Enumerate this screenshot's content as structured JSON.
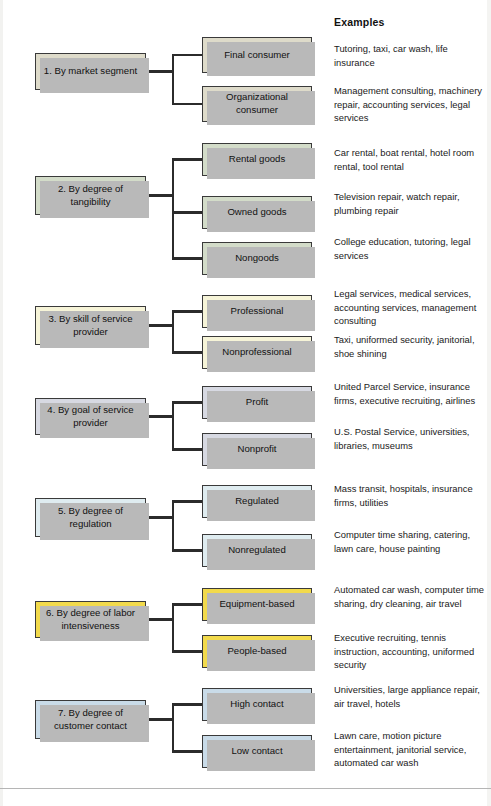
{
  "header": {
    "examples_label": "Examples"
  },
  "colors": {
    "section1": "#dedbca",
    "section2": "#d3dcc9",
    "section3": "#f6f4d8",
    "section4": "#d7d9e2",
    "section5": "#dfecf0",
    "section6": "#f2da4c",
    "section7": "#c9dbe8",
    "box_border": "#3a3a3a",
    "connector": "#2b2b2b",
    "shadow": "#b9b9b9",
    "text": "#111111"
  },
  "sections": [
    {
      "id": "market-segment",
      "category": "1. By market segment",
      "color": "#dedbca",
      "children": [
        {
          "label": "Final consumer",
          "examples": "Tutoring, taxi, car wash, life insurance"
        },
        {
          "label": "Organizational consumer",
          "examples": "Management consulting, machinery repair, accounting services, legal services"
        }
      ]
    },
    {
      "id": "degree-of-tangibility",
      "category": "2. By degree of tangibility",
      "color": "#d3dcc9",
      "children": [
        {
          "label": "Rental goods",
          "examples": "Car rental, boat rental, hotel room rental, tool rental"
        },
        {
          "label": "Owned goods",
          "examples": "Television repair, watch repair, plumbing repair"
        },
        {
          "label": "Nongoods",
          "examples": "College education, tutoring, legal services"
        }
      ]
    },
    {
      "id": "skill-of-service-provider",
      "category": "3. By skill of service provider",
      "color": "#f6f4d8",
      "children": [
        {
          "label": "Professional",
          "examples": "Legal services, medical services, accounting services, management consulting"
        },
        {
          "label": "Nonprofessional",
          "examples": "Taxi, uniformed security, janitorial, shoe shining"
        }
      ]
    },
    {
      "id": "goal-of-service-provider",
      "category": "4. By goal of service provider",
      "color": "#d7d9e2",
      "children": [
        {
          "label": "Profit",
          "examples": "United Parcel Service, insurance firms, executive recruiting, airlines"
        },
        {
          "label": "Nonprofit",
          "examples": "U.S. Postal Service, universities, libraries, museums"
        }
      ]
    },
    {
      "id": "degree-of-regulation",
      "category": "5. By degree of regulation",
      "color": "#dfecf0",
      "children": [
        {
          "label": "Regulated",
          "examples": "Mass transit, hospitals, insurance firms, utilities"
        },
        {
          "label": "Nonregulated",
          "examples": "Computer time sharing, catering, lawn care, house painting"
        }
      ]
    },
    {
      "id": "degree-of-labor-intensiveness",
      "category": "6. By degree of labor intensiveness",
      "color": "#f2da4c",
      "children": [
        {
          "label": "Equipment-based",
          "examples": "Automated car wash, computer time sharing, dry cleaning, air travel"
        },
        {
          "label": "People-based",
          "examples": "Executive recruiting, tennis instruction, accounting, uniformed security"
        }
      ]
    },
    {
      "id": "degree-of-customer-contact",
      "category": "7. By degree of customer contact",
      "color": "#c9dbe8",
      "children": [
        {
          "label": "High contact",
          "examples": "Universities, large appliance repair, air travel, hotels"
        },
        {
          "label": "Low contact",
          "examples": "Lawn care, motion picture entertainment, janitorial service, automated car wash"
        }
      ]
    }
  ],
  "layout": {
    "sub_tops": [
      [
        37,
        86
      ],
      [
        143,
        196,
        242
      ],
      [
        295,
        336
      ],
      [
        386,
        433
      ],
      [
        485,
        534
      ],
      [
        588,
        635
      ],
      [
        688,
        735
      ]
    ],
    "sub_heights": [
      [
        36,
        36
      ],
      [
        33,
        33,
        33
      ],
      [
        33,
        33
      ],
      [
        33,
        33
      ],
      [
        33,
        33
      ],
      [
        33,
        33
      ],
      [
        33,
        33
      ]
    ],
    "cat_tops": [
      53,
      176,
      306,
      398,
      498,
      601,
      700
    ],
    "cat_heights": [
      37,
      39,
      39,
      37,
      39,
      37,
      39
    ],
    "example_tops": [
      [
        42,
        84
      ],
      [
        146,
        190,
        235
      ],
      [
        287,
        333
      ],
      [
        380,
        425
      ],
      [
        482,
        528
      ],
      [
        583,
        631
      ],
      [
        683,
        729
      ]
    ]
  }
}
